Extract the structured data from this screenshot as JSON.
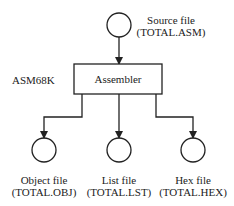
{
  "diagram": {
    "title_label": "ASM68K",
    "process": {
      "label": "Assembler"
    },
    "input": {
      "name": "Source file",
      "file": "(TOTAL.ASM)"
    },
    "outputs": [
      {
        "name": "Object file",
        "file": "(TOTAL.OBJ)"
      },
      {
        "name": "List file",
        "file": "(TOTAL.LST)"
      },
      {
        "name": "Hex file",
        "file": "(TOTAL.HEX)"
      }
    ]
  }
}
